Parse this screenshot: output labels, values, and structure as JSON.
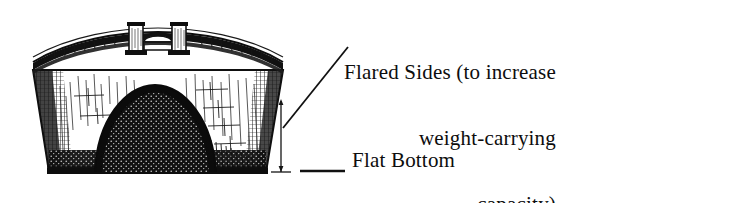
{
  "figure": {
    "background_color": "#ffffff",
    "ink_color": "#101010",
    "annotations": {
      "flared_sides": {
        "lines": [
          "Flared Sides (to increase",
          "weight-carrying",
          "capacity)"
        ],
        "line_1": "Flared Sides (to increase",
        "line_2": "weight-carrying",
        "line_3": "capacity)"
      },
      "flat_bottom": {
        "text": "Flat Bottom"
      }
    },
    "callouts": [
      {
        "name": "flared-sides-leader",
        "from": [
          283,
          128
        ],
        "to": [
          348,
          47
        ],
        "target": "starboard flared hull side"
      },
      {
        "name": "flat-bottom-leader",
        "from": [
          300,
          172
        ],
        "to": [
          345,
          172
        ],
        "target": "flat hull bottom"
      }
    ],
    "dimension_line": {
      "name": "hull-depth-dimension",
      "x": 281,
      "y_top": 100,
      "y_bottom": 172,
      "label": ""
    },
    "vessel": {
      "smokestacks": 2,
      "hull_profile": "flared sides, flat bottom",
      "deck_structure": "curved railed deck with pilot house",
      "hull_shading": "stipple and cross-hatch engraving"
    }
  }
}
